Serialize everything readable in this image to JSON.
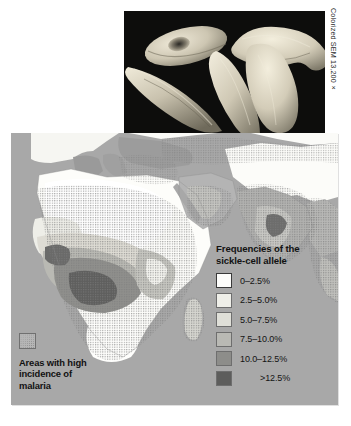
{
  "figure": {
    "photo": {
      "alt_name": "sickle-cell-red-blood-cells-sem",
      "background_color": "#0a0a0a",
      "cell_color": "#d8d2c0"
    },
    "credit": "Colorized SEM 13,200×"
  },
  "map": {
    "background_color": "#a8a8a8",
    "ocean_color": "#a8a8a8",
    "title": "",
    "regions_depicted": [
      "Africa",
      "Europe",
      "Middle East",
      "India",
      "Southeast Asia",
      "Madagascar"
    ]
  },
  "freq_legend": {
    "title_line1": "Frequencies of the",
    "title_line2": "sickle-cell allele",
    "items": [
      {
        "label": "0–2.5%",
        "color": "#fdfdfb",
        "outlined": true
      },
      {
        "label": "2.5–5.0%",
        "color": "#eeeee8",
        "outlined": false
      },
      {
        "label": "5.0–7.5%",
        "color": "#dfdfd8",
        "outlined": false
      },
      {
        "label": "7.5–10.0%",
        "color": "#b9b9b4",
        "outlined": false
      },
      {
        "label": "10.0–12.5%",
        "color": "#8d8d8a",
        "outlined": false
      },
      {
        "label": ">12.5%",
        "color": "#5d5d5c",
        "outlined": false,
        "indent": true
      }
    ]
  },
  "malaria_legend": {
    "swatch_name": "stipple-pattern-swatch",
    "line1": "Areas with high",
    "line2": "incidence of",
    "line3": "malaria"
  }
}
